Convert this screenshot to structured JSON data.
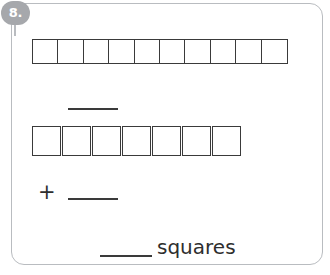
{
  "problem": {
    "number_label": "8.",
    "plus_operator": "+",
    "unit_label": "squares",
    "top_row": {
      "count": 10,
      "cells": [
        "",
        "",
        "",
        "",
        "",
        "",
        "",
        "",
        "",
        ""
      ]
    },
    "bottom_row": {
      "count": 7,
      "cells": [
        "",
        "",
        "",
        "",
        "",
        "",
        ""
      ]
    },
    "answer_blanks": {
      "first_addend": "",
      "second_addend": "",
      "total": ""
    },
    "colors": {
      "badge_fill": "#a6a8ac",
      "badge_text": "#ffffff",
      "card_border": "#b9bcc0",
      "square_border": "#3a3a3a",
      "text": "#2e2e2e",
      "page_background": "#ffffff"
    }
  }
}
